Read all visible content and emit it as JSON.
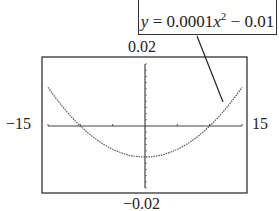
{
  "chart_data": {
    "type": "line",
    "title": "",
    "equation": "y = 0.0001x^2 - 0.01",
    "xlabel": "",
    "ylabel": "",
    "xlim": [
      -15,
      15
    ],
    "ylim": [
      -0.02,
      0.02
    ],
    "x_tick_spacing": 5,
    "y_tick_spacing": 0.002,
    "series": [
      {
        "name": "y = 0.0001x^2 - 0.01",
        "x": [
          -15,
          -12,
          -10,
          -8,
          -6,
          -4,
          -2,
          0,
          2,
          4,
          6,
          8,
          10,
          12,
          15
        ],
        "y": [
          0.0125,
          0.0044,
          0.0,
          -0.0036,
          -0.0064,
          -0.0084,
          -0.0096,
          -0.01,
          -0.0096,
          -0.0084,
          -0.0064,
          -0.0036,
          0.0,
          0.0044,
          0.0125
        ]
      }
    ],
    "grid": false,
    "legend": "callout"
  },
  "labels": {
    "ymax": "0.02",
    "ymin": "−0.02",
    "xmin": "−15",
    "xmax": "15"
  },
  "callout": {
    "prefix": "y",
    "text": " = 0.0001",
    "var": "x",
    "exp": "2",
    "suffix": " − 0.01"
  }
}
